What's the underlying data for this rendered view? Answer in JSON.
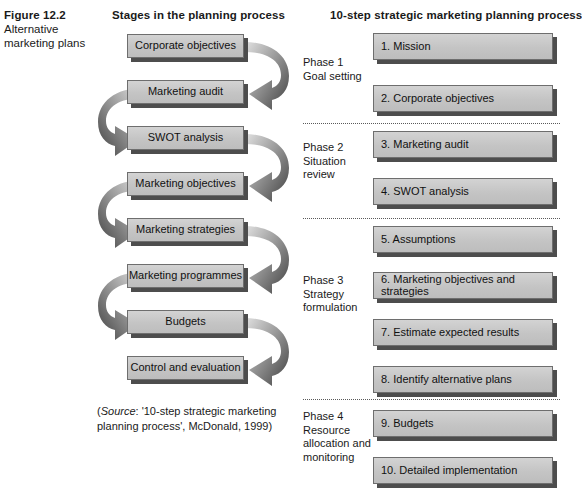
{
  "figure": {
    "number": "Figure 12.2",
    "title_line1": "Alternative",
    "title_line2": "marketing plans"
  },
  "columns": {
    "left_heading": "Stages in the planning process",
    "right_heading": "10-step strategic marketing planning process"
  },
  "left_stages": [
    {
      "label": "Corporate objectives"
    },
    {
      "label": "Marketing audit"
    },
    {
      "label": "SWOT analysis"
    },
    {
      "label": "Marketing objectives"
    },
    {
      "label": "Marketing strategies"
    },
    {
      "label": "Marketing programmes"
    },
    {
      "label": "Budgets"
    },
    {
      "label": "Control and evaluation"
    }
  ],
  "right_steps": [
    {
      "label": "1. Mission"
    },
    {
      "label": "2. Corporate objectives"
    },
    {
      "label": "3. Marketing audit"
    },
    {
      "label": "4. SWOT analysis"
    },
    {
      "label": "5. Assumptions"
    },
    {
      "label": "6. Marketing objectives and strategies"
    },
    {
      "label": "7. Estimate expected results"
    },
    {
      "label": "8. Identify alternative plans"
    },
    {
      "label": "9. Budgets"
    },
    {
      "label": "10. Detailed implementation"
    }
  ],
  "phases": [
    {
      "line1": "Phase 1",
      "line2": "Goal setting",
      "line3": "",
      "line4": ""
    },
    {
      "line1": "Phase 2",
      "line2": "Situation",
      "line3": "review",
      "line4": ""
    },
    {
      "line1": "Phase 3",
      "line2": "Strategy",
      "line3": "formulation",
      "line4": ""
    },
    {
      "line1": "Phase 4",
      "line2": "Resource",
      "line3": "allocation and",
      "line4": "monitoring"
    }
  ],
  "source": {
    "prefix": "(",
    "label": "Source",
    "text_line1": ": '10-step strategic marketing",
    "text_line2": "planning process', McDonald, 1999)"
  },
  "colors": {
    "box_fill_top": "#d3d3d3",
    "box_fill_bottom": "#bdbdbd",
    "box_border": "#6e6e6e",
    "box_shadow": "#4d4d4d",
    "arrow_dark": "#4a4a4a",
    "arrow_light": "#d8d8d8",
    "divider": "#5a5a5a",
    "text": "#111111",
    "background": "#ffffff"
  }
}
